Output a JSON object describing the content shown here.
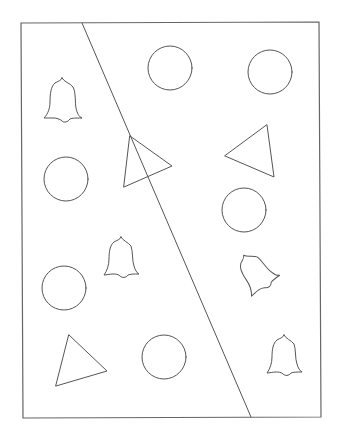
{
  "worksheet": {
    "title": "",
    "stroke_color": "#555555",
    "background": "#ffffff",
    "regions": [
      "left",
      "right"
    ],
    "shape_counts": {
      "circle": 7,
      "triangle": 3,
      "bell": 4
    },
    "shapes": [
      {
        "type": "bell",
        "region": "left",
        "orientation": "upright"
      },
      {
        "type": "circle",
        "region": "right"
      },
      {
        "type": "circle",
        "region": "right"
      },
      {
        "type": "triangle",
        "region": "crossing"
      },
      {
        "type": "triangle",
        "region": "right"
      },
      {
        "type": "circle",
        "region": "left"
      },
      {
        "type": "circle",
        "region": "right"
      },
      {
        "type": "bell",
        "region": "left",
        "orientation": "upright"
      },
      {
        "type": "bell",
        "region": "right",
        "orientation": "tilted"
      },
      {
        "type": "circle",
        "region": "left"
      },
      {
        "type": "triangle",
        "region": "left"
      },
      {
        "type": "circle",
        "region": "left"
      },
      {
        "type": "bell",
        "region": "right",
        "orientation": "upright"
      }
    ]
  }
}
